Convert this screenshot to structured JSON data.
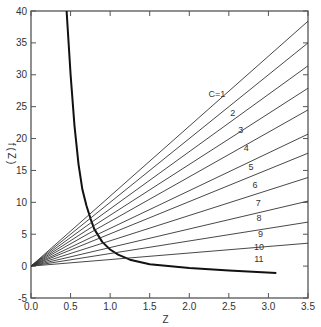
{
  "chart_data": {
    "type": "line",
    "title": "",
    "xlabel": "Z",
    "ylabel": "f(Z)",
    "xlim": [
      0.0,
      3.5
    ],
    "ylim": [
      -5,
      40
    ],
    "grid": false,
    "x_ticks": [
      "0.0",
      "0.5",
      "1.0",
      "1.5",
      "2.0",
      "2.5",
      "3.0",
      "3.5"
    ],
    "y_ticks": [
      "-5",
      "0",
      "5",
      "10",
      "15",
      "20",
      "25",
      "30",
      "35",
      "40"
    ],
    "series": [
      {
        "name": "f(Z) curve",
        "style": "bold",
        "x": [
          0.45,
          0.5,
          0.55,
          0.6,
          0.65,
          0.7,
          0.75,
          0.8,
          0.9,
          1.0,
          1.1,
          1.25,
          1.5,
          2.0,
          2.5,
          3.1
        ],
        "y": [
          40,
          30,
          22,
          16,
          12,
          9.5,
          7.5,
          5.8,
          3.8,
          2.6,
          1.8,
          1.0,
          0.3,
          -0.3,
          -0.7,
          -1.1
        ]
      },
      {
        "name": "C=1",
        "x": [
          0,
          3.5
        ],
        "y": [
          0,
          38.4
        ]
      },
      {
        "name": "2",
        "x": [
          0,
          3.5
        ],
        "y": [
          0,
          35.0
        ]
      },
      {
        "name": "3",
        "x": [
          0,
          3.5
        ],
        "y": [
          0,
          31.4
        ]
      },
      {
        "name": "4",
        "x": [
          0,
          3.5
        ],
        "y": [
          0,
          27.9
        ]
      },
      {
        "name": "5",
        "x": [
          0,
          3.5
        ],
        "y": [
          0,
          24.5
        ]
      },
      {
        "name": "6",
        "x": [
          0,
          3.5
        ],
        "y": [
          0,
          20.7
        ]
      },
      {
        "name": "7",
        "x": [
          0,
          3.5
        ],
        "y": [
          0,
          17.7
        ]
      },
      {
        "name": "8",
        "x": [
          0,
          3.5
        ],
        "y": [
          0,
          13.9
        ]
      },
      {
        "name": "9",
        "x": [
          0,
          3.5
        ],
        "y": [
          0,
          10.2
        ]
      },
      {
        "name": "10",
        "x": [
          0,
          3.5
        ],
        "y": [
          0,
          6.9
        ]
      },
      {
        "name": "11",
        "x": [
          0,
          3.5
        ],
        "y": [
          0,
          3.6
        ]
      }
    ],
    "annotations": [
      {
        "text": "C=1",
        "x": 2.35,
        "y": 26.5
      },
      {
        "text": "2",
        "x": 2.55,
        "y": 23.5
      },
      {
        "text": "3",
        "x": 2.65,
        "y": 20.8
      },
      {
        "text": "4",
        "x": 2.72,
        "y": 18.0
      },
      {
        "text": "5",
        "x": 2.78,
        "y": 15.0
      },
      {
        "text": "6",
        "x": 2.83,
        "y": 12.2
      },
      {
        "text": "7",
        "x": 2.87,
        "y": 9.5
      },
      {
        "text": "8",
        "x": 2.88,
        "y": 7.0
      },
      {
        "text": "9",
        "x": 2.9,
        "y": 4.6
      },
      {
        "text": "10",
        "x": 2.88,
        "y": 2.6
      },
      {
        "text": "11",
        "x": 2.88,
        "y": 0.7
      }
    ]
  }
}
